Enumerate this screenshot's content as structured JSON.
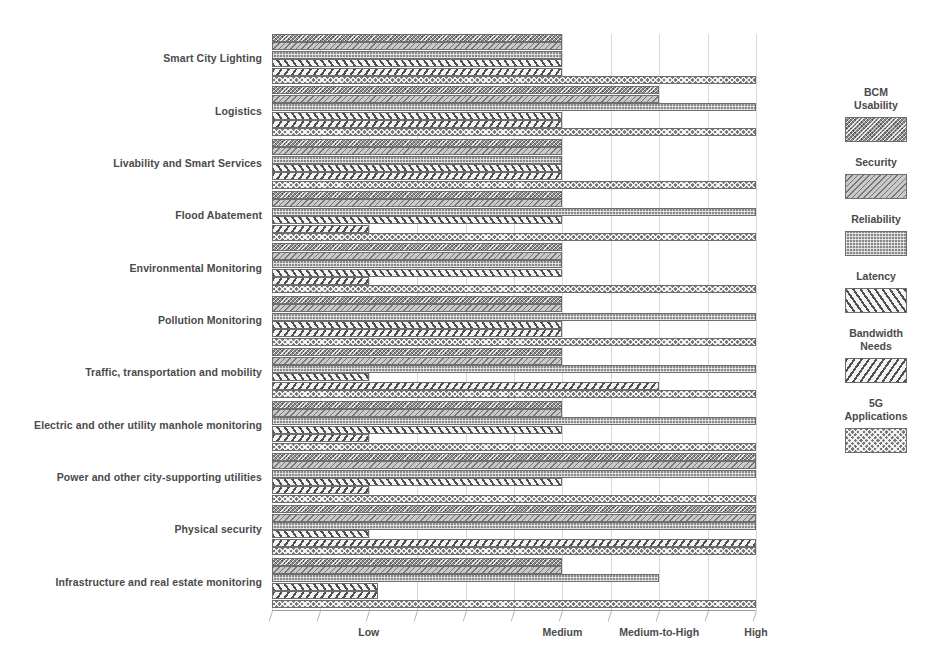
{
  "chart_data": {
    "type": "bar",
    "orientation": "horizontal",
    "title": "",
    "xlabel": "",
    "ylabel": "",
    "grid": true,
    "legend_position": "right",
    "xlim": [
      0,
      10
    ],
    "xticks": [
      0,
      1,
      2,
      3,
      4,
      5,
      6,
      7,
      8,
      9,
      10
    ],
    "xtick_labels": [
      "",
      "",
      "Low",
      "",
      "",
      "",
      "",
      "Medium",
      "",
      "Medium-to-High",
      "High"
    ],
    "labeled_ticks": [
      {
        "label": "Low",
        "value": 2
      },
      {
        "label": "Medium",
        "value": 6
      },
      {
        "label": "Medium-to-High",
        "value": 8
      },
      {
        "label": "High",
        "value": 10
      }
    ],
    "categories": [
      "Smart City Lighting",
      "Logistics",
      "Livability and Smart Services",
      "Flood Abatement",
      "Environmental Monitoring",
      "Pollution Monitoring",
      "Traffic, transportation and mobility",
      "Electric and other utility manhole monitoring",
      "Power and other city-supporting utilities",
      "Physical  security",
      "Infrastructure and real estate monitoring"
    ],
    "series": [
      {
        "name": "BCM Usability",
        "pattern": "pat-bcm",
        "values": [
          6,
          8,
          6,
          6,
          6,
          6,
          6,
          6,
          10,
          10,
          6
        ]
      },
      {
        "name": "Security",
        "pattern": "pat-security",
        "values": [
          6,
          8,
          6,
          6,
          6,
          6,
          6,
          6,
          10,
          10,
          6
        ]
      },
      {
        "name": "Reliability",
        "pattern": "pat-reliability",
        "values": [
          6,
          10,
          6,
          10,
          6,
          10,
          10,
          10,
          10,
          10,
          8
        ]
      },
      {
        "name": "Latency",
        "pattern": "pat-latency",
        "values": [
          6,
          6,
          6,
          6,
          6,
          6,
          2,
          6,
          6,
          2,
          2.2
        ]
      },
      {
        "name": "Bandwidth Needs",
        "pattern": "pat-bandwidth",
        "values": [
          6,
          6,
          6,
          2,
          2,
          6,
          8,
          2,
          2,
          10,
          2.2
        ]
      },
      {
        "name": "5G Applications",
        "pattern": "pat-5g",
        "values": [
          10,
          10,
          10,
          10,
          10,
          10,
          10,
          10,
          10,
          10,
          10
        ]
      }
    ]
  },
  "legend": {
    "items": [
      {
        "label": "BCM\nUsability",
        "pattern": "pat-bcm"
      },
      {
        "label": "Security",
        "pattern": "pat-security"
      },
      {
        "label": "Reliability",
        "pattern": "pat-reliability"
      },
      {
        "label": "Latency",
        "pattern": "pat-latency"
      },
      {
        "label": "Bandwidth\nNeeds",
        "pattern": "pat-bandwidth"
      },
      {
        "label": "5G\nApplications",
        "pattern": "pat-5g"
      }
    ]
  },
  "colors": {
    "gridline": "#d8d8d8",
    "axis": "#9a9a9a",
    "text": "#4a4a4a",
    "bar_outline": "#6d6d6d",
    "background": "#ffffff"
  }
}
